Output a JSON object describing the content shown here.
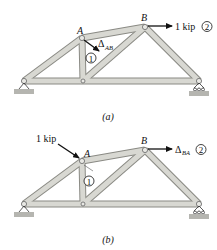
{
  "figure_a": {
    "caption": "(a)",
    "joint_A": "A",
    "joint_B": "B",
    "load_label": "1 kip",
    "load_circle": "2",
    "disp_label": "Δ",
    "disp_sub": "AB",
    "disp_circle": "1"
  },
  "figure_b": {
    "caption": "(b)",
    "joint_A": "A",
    "joint_B": "B",
    "load_label": "1 kip",
    "load_circle": "1",
    "disp_label": "Δ",
    "disp_sub": "BA",
    "disp_circle": "2"
  },
  "colors": {
    "member_fill": "#d6d6d0",
    "member_edge": "#8a8a84",
    "ground": "#b5b5b0",
    "arrow": "#111111"
  }
}
